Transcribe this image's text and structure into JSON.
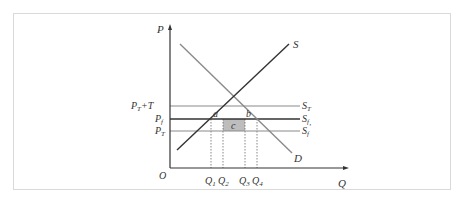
{
  "diagram": {
    "type": "supply-demand tariff/quota diagram",
    "axes": {
      "y_label": "P",
      "x_label": "Q",
      "origin_label": "O"
    },
    "price_levels": [
      {
        "id": "pt_plus_t",
        "label_main": "P",
        "label_sub": "T",
        "label_suffix": "+T",
        "line_label_main": "S",
        "line_label_sub": "T",
        "line_label_prime": ""
      },
      {
        "id": "pf",
        "label_main": "P",
        "label_sub": "f",
        "label_suffix": "",
        "line_label_main": "S",
        "line_label_sub": "f",
        "line_label_prime": ""
      },
      {
        "id": "pt",
        "label_main": "P",
        "label_sub": "T",
        "label_suffix": "",
        "line_label_main": "S",
        "line_label_sub": "f",
        "line_label_prime": "′"
      }
    ],
    "curves": {
      "supply": "S",
      "demand": "D"
    },
    "quantity_marks": [
      {
        "main": "Q",
        "sub": "1"
      },
      {
        "main": "Q",
        "sub": "2"
      },
      {
        "main": "Q",
        "sub": "3"
      },
      {
        "main": "Q",
        "sub": "4"
      }
    ],
    "areas": {
      "a": "a",
      "b": "b",
      "c": "c"
    },
    "colors": {
      "supply_line": "#333333",
      "demand_line": "#8a8a8a",
      "pt_plus_t_line": "#8a8a8a",
      "pf_line": "#333333",
      "pt_line": "#8a8a8a",
      "area_c_fill": "#bdbdbd",
      "axis": "#333333",
      "frame": "#d9d9d9"
    }
  }
}
